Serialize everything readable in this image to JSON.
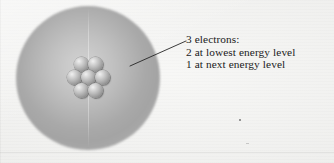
{
  "figure": {
    "type": "atom-diagram",
    "width": 334,
    "height": 163,
    "background_color": "#f3f3f1"
  },
  "electron_cloud": {
    "name": "electron-cloud",
    "center_x": 88,
    "center_y": 78,
    "radius": 72,
    "center_color": "#d2d2d2",
    "ring_color": "#a4a4a4",
    "edge_color": "#f3f3f1"
  },
  "nucleus": {
    "name": "nucleus",
    "nucleon_count": 7,
    "nucleon_color": "#bdbdbd",
    "arrangement": "hexagonal-close-packed",
    "nucleons": [
      {
        "id": "nucleon-top-left",
        "x": 7,
        "y": 0
      },
      {
        "id": "nucleon-top-right",
        "x": 21,
        "y": 0
      },
      {
        "id": "nucleon-middle-left",
        "x": 0,
        "y": 13
      },
      {
        "id": "nucleon-middle-center",
        "x": 14,
        "y": 13
      },
      {
        "id": "nucleon-middle-right",
        "x": 28,
        "y": 13
      },
      {
        "id": "nucleon-bottom-left",
        "x": 7,
        "y": 26
      },
      {
        "id": "nucleon-bottom-right",
        "x": 21,
        "y": 26
      }
    ]
  },
  "leader_line": {
    "name": "leader-line",
    "x1": 130,
    "y1": 66,
    "x2": 186,
    "y2": 41,
    "color": "#262626",
    "width": 0.9
  },
  "caption": {
    "name": "caption",
    "lines": [
      "3 electrons:",
      "2 at lowest energy level",
      "1 at next energy level"
    ],
    "line1": "3 electrons:",
    "line2": "2 at lowest energy level",
    "line3": "1 at next energy level",
    "color": "#1b1b1b"
  }
}
